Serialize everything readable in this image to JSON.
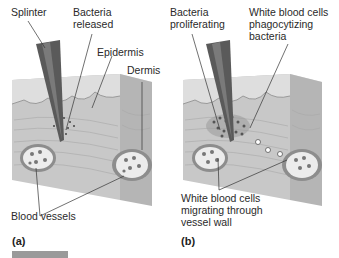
{
  "figure": {
    "panels": [
      {
        "id": "a",
        "letter": "(a)",
        "labels": {
          "splinter": "Splinter",
          "bacteria_released": "Bacteria\nreleased",
          "epidermis": "Epidermis",
          "dermis": "Dermis",
          "blood_vessels": "Blood vessels"
        }
      },
      {
        "id": "b",
        "letter": "(b)",
        "labels": {
          "bacteria_proliferating": "Bacteria\nproliferating",
          "wbc_phagocytizing": "White blood cells\nphagocytizing\nbacteria",
          "wbc_migrating": "White blood cells\nmigrating through\nvessel wall"
        }
      }
    ],
    "colors": {
      "skin_top": "#d8d8d8",
      "skin_side": "#bdbdbd",
      "dermis": "#c9c9c9",
      "splinter": "#555555",
      "vessel": "#e6e6e6",
      "leader": "#333333"
    }
  }
}
